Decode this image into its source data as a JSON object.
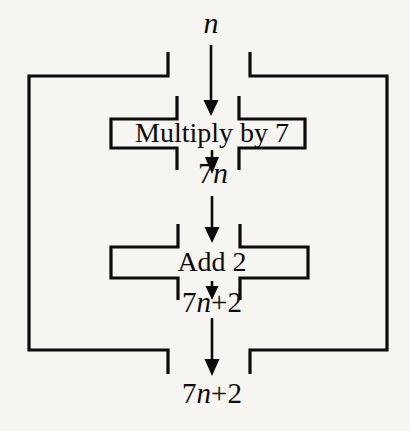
{
  "diagram": {
    "type": "function-machine-flowchart",
    "background_color": "#f7f5f1",
    "ink_color": "#0b0b0b",
    "canvas": {
      "width": 410,
      "height": 431
    },
    "nodes": [
      {
        "id": "outer-machine",
        "kind": "machine-box",
        "label": "",
        "shape": "open-bracket-rectangle",
        "bounds": {
          "x": 28,
          "y": 75,
          "width": 360,
          "height": 276
        }
      },
      {
        "id": "multiply-machine",
        "kind": "machine-box",
        "label": "Multiply by 7",
        "shape": "open-bracket-rectangle",
        "bounds": {
          "x": 110,
          "y": 118,
          "width": 196,
          "height": 31
        }
      },
      {
        "id": "add-machine",
        "kind": "machine-box",
        "label": "Add 2",
        "shape": "open-bracket-rectangle",
        "bounds": {
          "x": 110,
          "y": 246,
          "width": 198,
          "height": 33
        }
      }
    ],
    "labels": [
      {
        "id": "input-n",
        "text_plain": "n",
        "prefix": "",
        "italic": "n",
        "suffix": "",
        "x": 211,
        "y": 22,
        "role": "input-value"
      },
      {
        "id": "intermediate-7n",
        "text_plain": "7n",
        "prefix": "7",
        "italic": "n",
        "suffix": "",
        "x": 213,
        "y": 172,
        "role": "intermediate-value"
      },
      {
        "id": "output-7n2-inner",
        "text_plain": "7n+2",
        "prefix": "7",
        "italic": "n",
        "suffix": "+2",
        "x": 212,
        "y": 301,
        "role": "intermediate-value"
      },
      {
        "id": "output-7n2-final",
        "text_plain": "7n+2",
        "prefix": "7",
        "italic": "n",
        "suffix": "+2",
        "x": 212,
        "y": 393,
        "role": "output-value"
      }
    ],
    "arrows": [
      {
        "id": "arrow-n-to-multiply",
        "from": "input-n",
        "to": "multiply-machine",
        "x": 211,
        "y1": 45,
        "y2": 112
      },
      {
        "id": "arrow-multiply-to-7n",
        "from": "multiply-machine",
        "to": "intermediate-7n",
        "x": 212,
        "y1": 150,
        "y2": 172
      },
      {
        "id": "arrow-7n-to-add",
        "from": "intermediate-7n",
        "to": "add-machine",
        "x": 212,
        "y1": 196,
        "y2": 240
      },
      {
        "id": "arrow-add-to-7n2",
        "from": "add-machine",
        "to": "output-7n2-inner",
        "x": 212,
        "y1": 280,
        "y2": 300
      },
      {
        "id": "arrow-7n2-to-final",
        "from": "output-7n2-inner",
        "to": "output-7n2-final",
        "x": 212,
        "y1": 318,
        "y2": 372
      }
    ]
  }
}
